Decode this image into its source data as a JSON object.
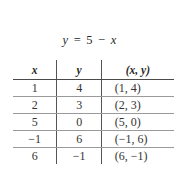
{
  "equation": {
    "lhs": "y",
    "equals": "=",
    "constant": "5",
    "minus": "−",
    "variable": "x"
  },
  "table": {
    "headers": {
      "x": "x",
      "y": "y",
      "pair": "(x, y)"
    },
    "rows": [
      {
        "x": "1",
        "y": "4",
        "pair": "(1, 4)"
      },
      {
        "x": "2",
        "y": "3",
        "pair": "(2, 3)"
      },
      {
        "x": "5",
        "y": "0",
        "pair": "(5, 0)"
      },
      {
        "x": "−1",
        "y": "6",
        "pair": "(−1, 6)"
      },
      {
        "x": "6",
        "y": "−1",
        "pair": "(6, −1)"
      }
    ]
  }
}
